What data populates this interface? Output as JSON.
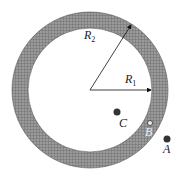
{
  "diagram": {
    "center": [
      90,
      90
    ],
    "outer_radius": 78,
    "inner_radius": 62,
    "ring_color": "#8a8a8a",
    "labels": {
      "R2": {
        "main": "R",
        "sub": "2"
      },
      "R1": {
        "main": "R",
        "sub": "1"
      },
      "A": "A",
      "B": "B",
      "C": "C"
    },
    "points": [
      {
        "name": "C",
        "x": 117,
        "y": 112
      },
      {
        "name": "B",
        "x": 150,
        "y": 123
      },
      {
        "name": "A",
        "x": 167,
        "y": 139
      }
    ]
  }
}
